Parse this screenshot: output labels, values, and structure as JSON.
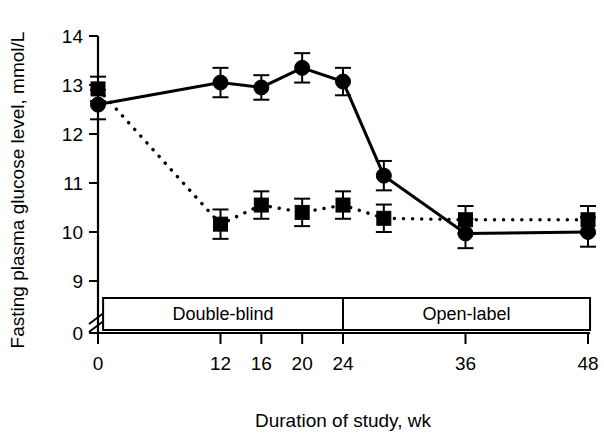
{
  "chart_data": {
    "type": "line",
    "title": "",
    "xlabel": "Duration of study, wk",
    "ylabel": "Fasting plasma glucose level, mmol/L",
    "x": [
      0,
      12,
      16,
      20,
      24,
      28,
      36,
      48
    ],
    "xticks": [
      "0",
      "12",
      "16",
      "20",
      "24",
      "36",
      "48"
    ],
    "xtick_values": [
      0,
      12,
      16,
      20,
      24,
      36,
      48
    ],
    "yticks": [
      "14",
      "13",
      "12",
      "11",
      "10",
      "9",
      "0"
    ],
    "ytick_values": [
      14,
      13,
      12,
      11,
      10,
      9,
      0
    ],
    "ylim": [
      8.7,
      14.0
    ],
    "xlim": [
      -1.5,
      49.5
    ],
    "y_axis_break": true,
    "grid": false,
    "legend": "none",
    "series": [
      {
        "name": "solid-circle-series",
        "marker": "circle",
        "linestyle": "solid",
        "color": "#000000",
        "x": [
          0,
          12,
          16,
          20,
          24,
          28,
          36,
          48
        ],
        "values": [
          12.6,
          13.05,
          12.95,
          13.35,
          13.07,
          11.15,
          9.97,
          10.0
        ],
        "err_low": [
          0.3,
          0.3,
          0.25,
          0.3,
          0.28,
          0.3,
          0.3,
          0.3
        ],
        "err_high": [
          0.3,
          0.3,
          0.25,
          0.3,
          0.28,
          0.3,
          0.3,
          0.3
        ]
      },
      {
        "name": "dotted-square-series",
        "marker": "square",
        "linestyle": "dotted",
        "color": "#000000",
        "x": [
          0,
          12,
          16,
          20,
          24,
          28,
          36,
          48
        ],
        "values": [
          12.92,
          10.16,
          10.55,
          10.4,
          10.55,
          10.28,
          10.25,
          10.25
        ],
        "err_low": [
          0.25,
          0.3,
          0.28,
          0.28,
          0.28,
          0.28,
          0.28,
          0.28
        ],
        "err_high": [
          0.25,
          0.3,
          0.28,
          0.28,
          0.28,
          0.28,
          0.28,
          0.28
        ]
      }
    ],
    "annotations": {
      "phase_box": {
        "left_label": "Double-blind",
        "right_label": "Open-label",
        "divider_x": 24,
        "box_start_x": 0.5,
        "box_end_x": 48.2
      }
    }
  },
  "axes": {
    "x_title": "Duration of study, wk",
    "y_title": "Fasting plasma glucose level, mmol/L"
  },
  "colors": {
    "ink": "#000000",
    "background": "#ffffff"
  }
}
